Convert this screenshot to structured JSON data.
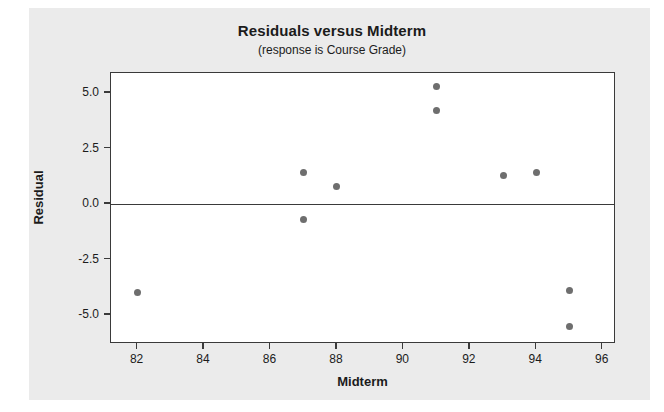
{
  "chart_data": {
    "type": "scatter",
    "title": "Residuals versus Midterm",
    "subtitle": "(response is Course Grade)",
    "xlabel": "Midterm",
    "ylabel": "Residual",
    "xlim": [
      81.2,
      96.4
    ],
    "ylim": [
      -6.3,
      5.9
    ],
    "xticks": [
      82,
      84,
      86,
      88,
      90,
      92,
      94,
      96
    ],
    "xtick_labels": [
      "82",
      "84",
      "86",
      "88",
      "90",
      "92",
      "94",
      "96"
    ],
    "yticks": [
      5.0,
      2.5,
      0.0,
      -2.5,
      -5.0
    ],
    "ytick_labels": [
      "5.0",
      "2.5",
      "0.0",
      "-2.5",
      "-5.0"
    ],
    "grid": false,
    "legend": false,
    "reference_line": 0.0,
    "marker_color": "#6e6e6e",
    "frame_color": "#3a3a3a",
    "background_color": "#ebebeb",
    "plot_background_color": "#ffffff",
    "points": [
      {
        "x": 82,
        "y": -4.0
      },
      {
        "x": 87,
        "y": 1.4
      },
      {
        "x": 87,
        "y": -0.7
      },
      {
        "x": 88,
        "y": 0.8
      },
      {
        "x": 91,
        "y": 5.3
      },
      {
        "x": 91,
        "y": 4.2
      },
      {
        "x": 93,
        "y": 1.3
      },
      {
        "x": 94,
        "y": 1.4
      },
      {
        "x": 95,
        "y": -3.9
      },
      {
        "x": 95,
        "y": -5.5
      }
    ]
  }
}
